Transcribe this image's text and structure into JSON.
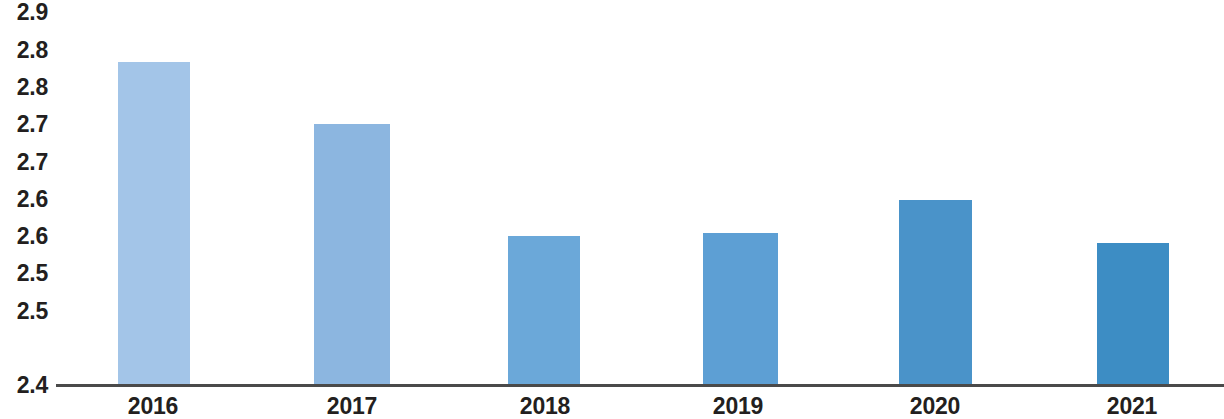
{
  "chart_data": {
    "type": "bar",
    "title": "",
    "subtitle": "",
    "xlabel": "",
    "ylabel": "",
    "categories": [
      "2016",
      "2017",
      "2018",
      "2019",
      "2020",
      "2021"
    ],
    "values": [
      2.8,
      2.75,
      2.58,
      2.58,
      2.66,
      2.56
    ],
    "series": [
      {
        "name": "",
        "values": [
          2.8,
          2.75,
          2.58,
          2.58,
          2.66,
          2.56
        ]
      }
    ],
    "ylim": [
      2.4,
      2.9
    ],
    "y_tick_values": [
      2.9,
      2.85,
      2.8,
      2.75,
      2.7,
      2.65,
      2.6,
      2.55,
      2.5,
      2.45,
      2.4
    ],
    "y_tick_labels": [
      "2.9",
      "2.8",
      "2.8",
      "2.7",
      "2.7",
      "2.6",
      "2.6",
      "2.5",
      "2.5",
      "2.4"
    ],
    "x_tick_labels": [
      "2016",
      "2017",
      "2018",
      "2019",
      "2020",
      "2021"
    ],
    "grid": false,
    "legend": "none",
    "annotations": [],
    "bar_colors": [
      "#a3c5e8",
      "#8cb6e0",
      "#6ba8d9",
      "#5d9fd4",
      "#4a93c9",
      "#3d8dc4"
    ],
    "axis_color": "#4a4a4a",
    "text_color": "#231f20",
    "background_color": "#ffffff"
  },
  "y_axis": {
    "labels": [
      {
        "text": "2.9",
        "y": 12
      },
      {
        "text": "2.8",
        "y": 50
      },
      {
        "text": "2.8",
        "y": 87
      },
      {
        "text": "2.7",
        "y": 124
      },
      {
        "text": "2.7",
        "y": 162
      },
      {
        "text": "2.6",
        "y": 199
      },
      {
        "text": "2.6",
        "y": 236
      },
      {
        "text": "2.5",
        "y": 273
      },
      {
        "text": "2.5",
        "y": 311
      },
      {
        "text": "2.4",
        "y": 385
      }
    ]
  },
  "bars": [
    {
      "label": "2016",
      "value": 2.8,
      "color": "#a3c5e8",
      "left": 118,
      "width": 72,
      "top": 62,
      "label_x": 153
    },
    {
      "label": "2017",
      "value": 2.75,
      "color": "#8cb6e0",
      "left": 314,
      "width": 76,
      "top": 124,
      "label_x": 352
    },
    {
      "label": "2018",
      "value": 2.58,
      "color": "#6ba8d9",
      "left": 508,
      "width": 72,
      "top": 236,
      "label_x": 545
    },
    {
      "label": "2019",
      "value": 2.58,
      "color": "#5d9fd4",
      "left": 703,
      "width": 75,
      "top": 233,
      "label_x": 738
    },
    {
      "label": "2020",
      "value": 2.66,
      "color": "#4a93c9",
      "left": 899,
      "width": 73,
      "top": 200,
      "label_x": 935
    },
    {
      "label": "2021",
      "value": 2.56,
      "color": "#3d8dc4",
      "left": 1097,
      "width": 72,
      "top": 243,
      "label_x": 1132
    }
  ]
}
